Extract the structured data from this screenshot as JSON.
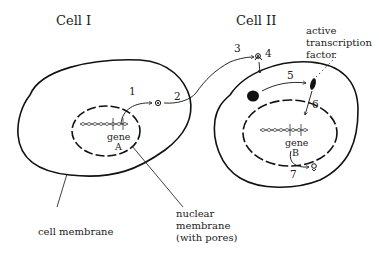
{
  "diagram": {
    "cell_1": {
      "title": "Cell I",
      "gene_label": "gene",
      "gene_id": "A",
      "step_1": "1",
      "step_2": "2"
    },
    "cell_2": {
      "title": "Cell II",
      "gene_label": "gene",
      "gene_id": "B",
      "step_3": "3",
      "step_4": "4",
      "step_5": "5",
      "step_6": "6",
      "step_7": "7",
      "tf_label_line1": "active",
      "tf_label_line2": "transcription",
      "tf_label_line3": "factor"
    },
    "callouts": {
      "cell_membrane": "cell membrane",
      "nuclear_membrane_line1": "nuclear",
      "nuclear_membrane_line2": "membrane",
      "nuclear_membrane_line3": "(with pores)"
    },
    "colors": {
      "stroke": "#111111",
      "text": "#222222",
      "background": "#ffffff"
    }
  }
}
